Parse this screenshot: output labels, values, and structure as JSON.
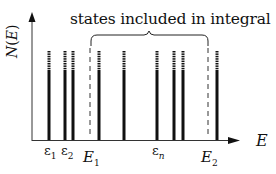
{
  "diagram": {
    "caption": "states included in integral",
    "y_axis_label": "N(E)",
    "y_axis_label_parts": {
      "func": "N",
      "open": "(",
      "var": "E",
      "close": ")"
    },
    "x_axis_label": "E",
    "tick_labels": [
      {
        "id": "eps1",
        "base": "ε",
        "sub": "1",
        "x": 44
      },
      {
        "id": "eps2",
        "base": "ε",
        "sub": "2",
        "x": 61
      },
      {
        "id": "epsn",
        "base": "ε",
        "sub": "n",
        "x": 152
      }
    ],
    "bound_labels": [
      {
        "id": "E1",
        "base": "E",
        "sub": "1",
        "x": 83
      },
      {
        "id": "E2",
        "base": "E",
        "sub": "2",
        "x": 201
      }
    ],
    "energy_levels_x": [
      49,
      65,
      73,
      99,
      124,
      157,
      174,
      183,
      217
    ],
    "integration_bounds_x": [
      90,
      208
    ],
    "colors": {
      "ink": "#111111",
      "axis": "#333333",
      "background": "#ffffff"
    }
  }
}
